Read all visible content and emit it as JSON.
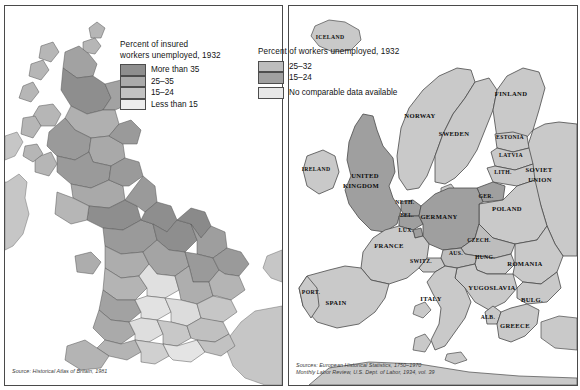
{
  "figure": {
    "kind": "two-panel thematic map figure",
    "title_visible": false
  },
  "left_map": {
    "name": "british-isles-unemployment-1932",
    "legend": {
      "title": "Percent of insured\nworkers unemployed, 1932",
      "entries": [
        {
          "label": "More than 35",
          "color": "#8e8e8e"
        },
        {
          "label": "25–35",
          "color": "#aaaaaa"
        },
        {
          "label": "15–24",
          "color": "#c2c2c2"
        },
        {
          "label": "Less than 15",
          "color": "#ededed"
        }
      ]
    },
    "source": "Source: Historical Atlas of Britain, 1981"
  },
  "right_map": {
    "name": "europe-unemployment-1932",
    "legend": {
      "title": "Percent of workers unemployed, 1932",
      "entries": [
        {
          "label": "25–32",
          "color": "#bdbdbd"
        },
        {
          "label": "15–24",
          "color": "#a0a0a0"
        },
        {
          "label": "No comparable data available",
          "color": "#e8e8e8"
        }
      ]
    },
    "source": "Sources: European Historical Statistics, 1750–1970\nMonthly Labor Review, U.S. Dept. of Labor, 1934, vol. 39",
    "country_labels": [
      {
        "id": "iceland",
        "text": "ICELAND",
        "x": 41,
        "y": 33,
        "size": "sm"
      },
      {
        "id": "norway",
        "text": "NORWAY",
        "x": 131,
        "y": 112,
        "size": ""
      },
      {
        "id": "sweden",
        "text": "SWEDEN",
        "x": 165,
        "y": 130,
        "size": ""
      },
      {
        "id": "finland",
        "text": "FINLAND",
        "x": 222,
        "y": 90,
        "size": ""
      },
      {
        "id": "estonia",
        "text": "ESTONIA",
        "x": 221,
        "y": 133,
        "size": "sm"
      },
      {
        "id": "latvia",
        "text": "LATVIA",
        "x": 222,
        "y": 151,
        "size": "sm"
      },
      {
        "id": "lithuania",
        "text": "LITH.",
        "x": 214,
        "y": 168,
        "size": "sm"
      },
      {
        "id": "soviet",
        "text": "SOVIET",
        "x": 250,
        "y": 166,
        "size": ""
      },
      {
        "id": "soviet2",
        "text": "UNION",
        "x": 251,
        "y": 176,
        "size": ""
      },
      {
        "id": "ireland",
        "text": "IRELAND",
        "x": 27,
        "y": 165,
        "size": "sm"
      },
      {
        "id": "uk",
        "text": "UNITED",
        "x": 76,
        "y": 172,
        "size": ""
      },
      {
        "id": "uk2",
        "text": "KINGDOM",
        "x": 72,
        "y": 182,
        "size": ""
      },
      {
        "id": "netherlands",
        "text": "NETH.",
        "x": 116,
        "y": 198,
        "size": "sm"
      },
      {
        "id": "germany_e",
        "text": "GER.",
        "x": 197,
        "y": 192,
        "size": "sm"
      },
      {
        "id": "poland",
        "text": "POLAND",
        "x": 218,
        "y": 205,
        "size": ""
      },
      {
        "id": "belgium",
        "text": "BEL.",
        "x": 118,
        "y": 211,
        "size": "sm"
      },
      {
        "id": "germany",
        "text": "GERMANY",
        "x": 150,
        "y": 213,
        "size": ""
      },
      {
        "id": "lux",
        "text": "LUX.",
        "x": 117,
        "y": 226,
        "size": "sm"
      },
      {
        "id": "czech",
        "text": "CZECH.",
        "x": 190,
        "y": 236,
        "size": "sm"
      },
      {
        "id": "france",
        "text": "FRANCE",
        "x": 100,
        "y": 242,
        "size": ""
      },
      {
        "id": "austria",
        "text": "AUS.",
        "x": 167,
        "y": 249,
        "size": "sm"
      },
      {
        "id": "hungary",
        "text": "HUNG.",
        "x": 196,
        "y": 253,
        "size": "sm"
      },
      {
        "id": "switz",
        "text": "SWITZ.",
        "x": 132,
        "y": 257,
        "size": "sm"
      },
      {
        "id": "romania",
        "text": "ROMANIA",
        "x": 236,
        "y": 260,
        "size": ""
      },
      {
        "id": "yugoslavia",
        "text": "YUGOSLAVIA",
        "x": 203,
        "y": 284,
        "size": ""
      },
      {
        "id": "portugal",
        "text": "PORT.",
        "x": 22,
        "y": 288,
        "size": "sm"
      },
      {
        "id": "spain",
        "text": "SPAIN",
        "x": 47,
        "y": 299,
        "size": ""
      },
      {
        "id": "italy",
        "text": "ITALY",
        "x": 142,
        "y": 295,
        "size": ""
      },
      {
        "id": "bulgaria",
        "text": "BULG.",
        "x": 243,
        "y": 296,
        "size": ""
      },
      {
        "id": "albania",
        "text": "ALB.",
        "x": 199,
        "y": 313,
        "size": "sm"
      },
      {
        "id": "greece",
        "text": "GREECE",
        "x": 226,
        "y": 322,
        "size": ""
      }
    ]
  },
  "palette": {
    "sea": "#ffffff",
    "land_no_data": "#c9c9c9",
    "band_25_32": "#bdbdbd",
    "band_15_24": "#9f9f9f",
    "border": "#4a4a4a",
    "text": "#131313"
  }
}
